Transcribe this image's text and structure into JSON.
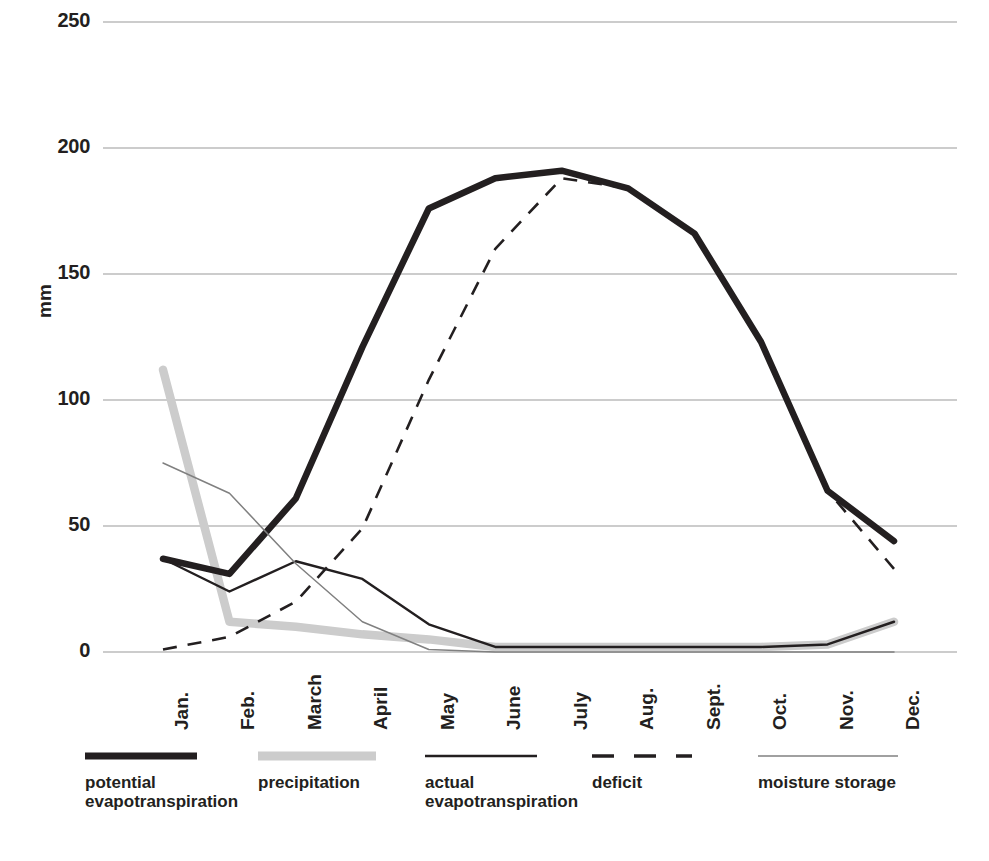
{
  "chart_data": {
    "type": "line",
    "title": "",
    "xlabel": "",
    "ylabel": "mm",
    "ylim": [
      0,
      250
    ],
    "yticks": [
      0,
      50,
      100,
      150,
      200,
      250
    ],
    "grid": true,
    "legend_position": "bottom",
    "categories": [
      "Jan.",
      "Feb.",
      "March",
      "April",
      "May",
      "June",
      "July",
      "Aug.",
      "Sept.",
      "Oct.",
      "Nov.",
      "Dec."
    ],
    "series": [
      {
        "name": "potential evapotranspiration",
        "style": "thick-solid",
        "color": "#231f20",
        "values": [
          37,
          31,
          61,
          121,
          176,
          188,
          191,
          184,
          166,
          123,
          64,
          44
        ]
      },
      {
        "name": "precipitation",
        "style": "thick-solid-light",
        "color": "#cccccc",
        "values": [
          112,
          12,
          10,
          7,
          5,
          2,
          2,
          2,
          2,
          2,
          3,
          12
        ]
      },
      {
        "name": "actual evapotranspiration",
        "style": "thin-solid",
        "color": "#231f20",
        "values": [
          37,
          24,
          36,
          29,
          11,
          2,
          2,
          2,
          2,
          2,
          3,
          12
        ]
      },
      {
        "name": "deficit",
        "style": "dashed",
        "color": "#231f20",
        "values": [
          1,
          6,
          20,
          49,
          108,
          160,
          188,
          184,
          166,
          123,
          64,
          33
        ]
      },
      {
        "name": "moisture storage",
        "style": "hairline",
        "color": "#808080",
        "values": [
          75,
          63,
          35,
          12,
          1,
          0,
          0,
          0,
          0,
          0,
          0,
          0
        ]
      }
    ]
  },
  "axis": {
    "y_title": "mm",
    "y_tick_labels": [
      "250",
      "200",
      "150",
      "100",
      "50",
      "0"
    ],
    "x_tick_labels": [
      "Jan.",
      "Feb.",
      "March",
      "April",
      "May",
      "June",
      "July",
      "Aug.",
      "Sept.",
      "Oct.",
      "Nov.",
      "Dec."
    ]
  },
  "legend": {
    "items": [
      {
        "label": "potential\nevapotranspiration",
        "swatch": "thick-black-line",
        "color": "#231f20"
      },
      {
        "label": "precipitation",
        "swatch": "thick-gray-line",
        "color": "#cccccc"
      },
      {
        "label": "actual\nevapotranspiration",
        "swatch": "thin-black-line",
        "color": "#231f20"
      },
      {
        "label": "deficit",
        "swatch": "dashed-black-line",
        "color": "#231f20"
      },
      {
        "label": "moisture storage",
        "swatch": "hairline-gray-line",
        "color": "#808080"
      }
    ]
  },
  "colors": {
    "ink": "#231f20",
    "grid": "#9a9a9a",
    "precipitation": "#cccccc",
    "moisture_storage": "#808080",
    "background": "#ffffff"
  }
}
